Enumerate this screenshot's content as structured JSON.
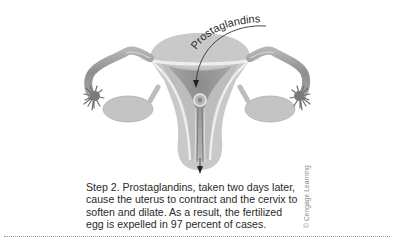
{
  "figure": {
    "label": "Prostaglandins",
    "caption_lines": [
      "Step 2. Prostaglandins, taken two days later,",
      "cause the uterus to contract and the cervix to",
      "soften and dilate. As a result, the fertilized",
      "egg is expelled in 97 percent of cases."
    ],
    "credit": "© Cengage Learning",
    "colors": {
      "uterus_fill": "#c9c9c9",
      "uterus_inner": "#a8a8a8",
      "tube": "#9a9a9a",
      "fimbriae": "#6e6e6e",
      "lining": "#eeeeee",
      "text": "#2a2a2a"
    }
  }
}
